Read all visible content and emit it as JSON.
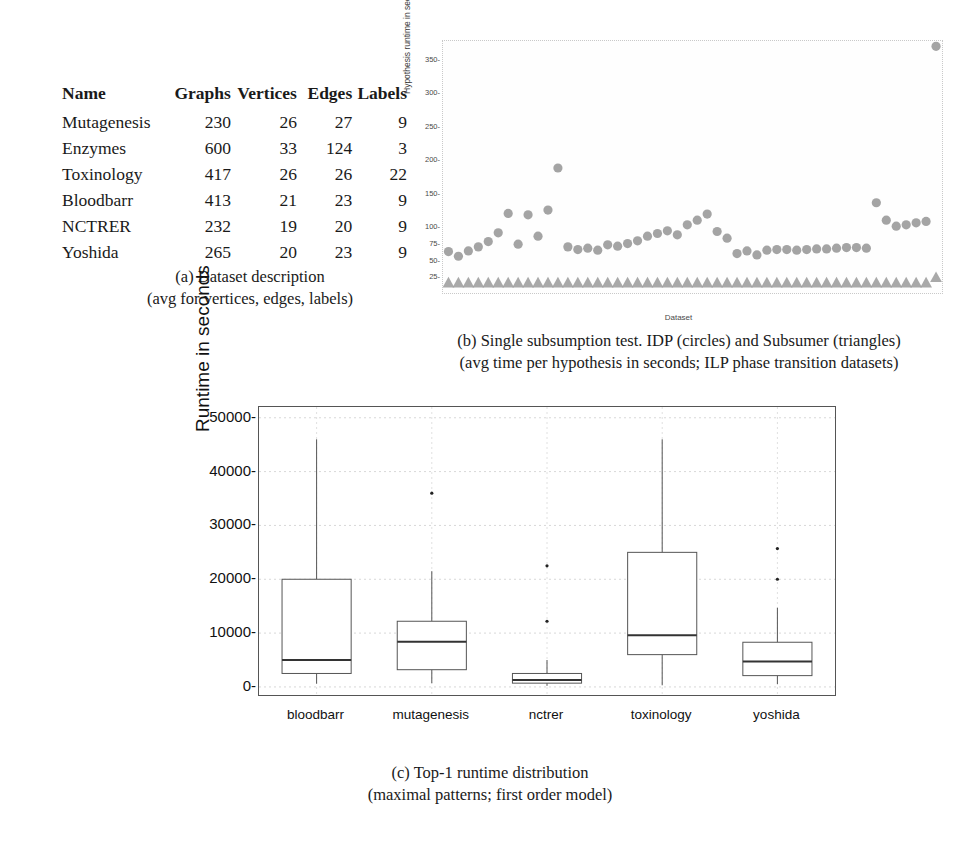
{
  "figure": {
    "panels": [
      "a",
      "b",
      "c"
    ]
  },
  "panel_a": {
    "name": "Dataset description table",
    "columns": [
      "Name",
      "Graphs",
      "Vertices",
      "Edges",
      "Labels"
    ],
    "rows": [
      {
        "name": "Mutagenesis",
        "graphs": "230",
        "vertices": "26",
        "edges": "27",
        "labels": "9"
      },
      {
        "name": "Enzymes",
        "graphs": "600",
        "vertices": "33",
        "edges": "124",
        "labels": "3"
      },
      {
        "name": "Toxinology",
        "graphs": "417",
        "vertices": "26",
        "edges": "26",
        "labels": "22"
      },
      {
        "name": "Bloodbarr",
        "graphs": "413",
        "vertices": "21",
        "edges": "23",
        "labels": "9"
      },
      {
        "name": "NCTRER",
        "graphs": "232",
        "vertices": "19",
        "edges": "20",
        "labels": "9"
      },
      {
        "name": "Yoshida",
        "graphs": "265",
        "vertices": "20",
        "edges": "23",
        "labels": "9"
      }
    ],
    "caption_line1": "(a) Dataset description",
    "caption_line2": "(avg for vertices, edges, labels)"
  },
  "panel_b": {
    "caption_line1": "(b) Single subsumption test. IDP (circles) and Subsumer (triangles)",
    "caption_line2": "(avg time per hypothesis in seconds; ILP phase transition datasets)"
  },
  "panel_c": {
    "caption_line1": "(c) Top-1 runtime distribution",
    "caption_line2": "(maximal patterns; first order model)"
  },
  "colors": {
    "marker_gray": "#9a9a9a",
    "axis_dark": "#555555",
    "grid_light": "#dcdcdc",
    "text": "#1a1a1a"
  },
  "chart_data": [
    {
      "type": "scatter",
      "panel": "b",
      "title": "",
      "xlabel": "Dataset",
      "ylabel": "Hypothesis runtime in seconds",
      "ylim": [
        0,
        380
      ],
      "yticks": [
        25,
        50,
        75,
        100,
        150,
        200,
        250,
        300,
        350
      ],
      "grid": false,
      "legend": [
        "IDP (circles)",
        "Subsumer (triangles)"
      ],
      "series": [
        {
          "name": "IDP (circles)",
          "marker": "circle",
          "color": "#9a9a9a",
          "x": [
            1,
            2,
            3,
            4,
            5,
            6,
            7,
            8,
            9,
            10,
            11,
            12,
            13,
            14,
            15,
            16,
            17,
            18,
            19,
            20,
            21,
            22,
            23,
            24,
            25,
            26,
            27,
            28,
            29,
            30,
            31,
            32,
            33,
            34,
            35,
            36,
            37,
            38,
            39,
            40,
            41,
            42,
            43,
            44,
            45,
            46,
            47,
            48,
            49,
            50
          ],
          "values": [
            65,
            58,
            66,
            72,
            80,
            93,
            122,
            76,
            120,
            88,
            127,
            190,
            72,
            68,
            70,
            67,
            75,
            73,
            77,
            81,
            88,
            92,
            96,
            90,
            105,
            112,
            121,
            95,
            85,
            62,
            66,
            60,
            67,
            68,
            68,
            67,
            68,
            69,
            69,
            70,
            71,
            71,
            70,
            138,
            112,
            103,
            105,
            108,
            110,
            372
          ]
        },
        {
          "name": "Subsumer (triangles)",
          "marker": "triangle",
          "color": "#9a9a9a",
          "x": [
            1,
            2,
            3,
            4,
            5,
            6,
            7,
            8,
            9,
            10,
            11,
            12,
            13,
            14,
            15,
            16,
            17,
            18,
            19,
            20,
            21,
            22,
            23,
            24,
            25,
            26,
            27,
            28,
            29,
            30,
            31,
            32,
            33,
            34,
            35,
            36,
            37,
            38,
            39,
            40,
            41,
            42,
            43,
            44,
            45,
            46,
            47,
            48,
            49,
            50
          ],
          "values": [
            18,
            18,
            18,
            18,
            18,
            18,
            18,
            18,
            18,
            18,
            18,
            18,
            18,
            18,
            18,
            18,
            18,
            18,
            18,
            18,
            18,
            18,
            18,
            18,
            18,
            18,
            18,
            18,
            18,
            18,
            18,
            18,
            18,
            18,
            18,
            18,
            18,
            18,
            18,
            18,
            18,
            18,
            18,
            18,
            18,
            18,
            18,
            18,
            18,
            26
          ]
        }
      ]
    },
    {
      "type": "boxplot",
      "panel": "c",
      "title": "",
      "xlabel": "",
      "ylabel": "Runtime in seconds",
      "ylim": [
        -1500,
        52000
      ],
      "yticks": [
        0,
        10000,
        20000,
        30000,
        40000,
        50000
      ],
      "categories": [
        "bloodbarr",
        "mutagenesis",
        "nctrer",
        "toxinology",
        "yoshida"
      ],
      "grid": true,
      "boxes": [
        {
          "category": "bloodbarr",
          "whisker_low": 600,
          "q1": 2500,
          "median": 5000,
          "q3": 20000,
          "whisker_high": 46000,
          "outliers": []
        },
        {
          "category": "mutagenesis",
          "whisker_low": 700,
          "q1": 3200,
          "median": 8400,
          "q3": 12200,
          "whisker_high": 21500,
          "outliers": [
            36000
          ]
        },
        {
          "category": "nctrer",
          "whisker_low": 200,
          "q1": 700,
          "median": 1300,
          "q3": 2500,
          "whisker_high": 5000,
          "outliers": [
            12200,
            22500
          ]
        },
        {
          "category": "toxinology",
          "whisker_low": 300,
          "q1": 6000,
          "median": 9600,
          "q3": 25000,
          "whisker_high": 46000,
          "outliers": []
        },
        {
          "category": "yoshida",
          "whisker_low": 500,
          "q1": 2100,
          "median": 4700,
          "q3": 8300,
          "whisker_high": 14700,
          "outliers": [
            20000,
            25700
          ]
        }
      ]
    }
  ]
}
